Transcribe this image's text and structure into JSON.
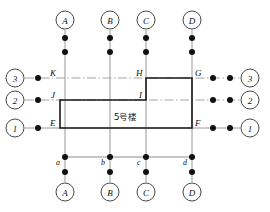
{
  "diagram": {
    "building_label": "5号楼",
    "colors": {
      "outline": "#1a1a1a",
      "gridline": "#8c8c8c",
      "centerline": "#9a9a9a",
      "node": "#111111",
      "background": "#ffffff"
    },
    "axis_top": [
      {
        "id": "A",
        "label": "A",
        "x": 65
      },
      {
        "id": "B",
        "label": "B",
        "x": 110
      },
      {
        "id": "C",
        "label": "C",
        "x": 146
      },
      {
        "id": "D",
        "label": "D",
        "x": 192
      }
    ],
    "axis_bottom": [
      {
        "id": "A",
        "label": "A",
        "x": 65
      },
      {
        "id": "B",
        "label": "B",
        "x": 110
      },
      {
        "id": "C",
        "label": "C",
        "x": 146
      },
      {
        "id": "D",
        "label": "D",
        "x": 192
      }
    ],
    "axis_left": [
      {
        "id": "3",
        "label": "3",
        "y": 78
      },
      {
        "id": "2",
        "label": "2",
        "y": 100
      },
      {
        "id": "1",
        "label": "1",
        "y": 128
      }
    ],
    "axis_right": [
      {
        "id": "3",
        "label": "3",
        "y": 78
      },
      {
        "id": "2",
        "label": "2",
        "y": 100
      },
      {
        "id": "1",
        "label": "1",
        "y": 128
      }
    ],
    "corner_points": [
      {
        "label": "K",
        "x": 60,
        "y": 78,
        "dx": -9,
        "dy": -3
      },
      {
        "label": "J",
        "x": 60,
        "y": 100,
        "dx": -9,
        "dy": -3
      },
      {
        "label": "E",
        "x": 60,
        "y": 128,
        "dx": -9,
        "dy": -3
      },
      {
        "label": "H",
        "x": 146,
        "y": 78,
        "dx": -9,
        "dy": -3
      },
      {
        "label": "I",
        "x": 146,
        "y": 100,
        "dx": -9,
        "dy": -3
      },
      {
        "label": "G",
        "x": 192,
        "y": 78,
        "dx": 3,
        "dy": -3
      },
      {
        "label": "F",
        "x": 192,
        "y": 128,
        "dx": 3,
        "dy": -3
      }
    ],
    "base_points": [
      {
        "label": "a",
        "x": 65,
        "y": 157
      },
      {
        "label": "b",
        "x": 110,
        "y": 157
      },
      {
        "label": "c",
        "x": 146,
        "y": 157
      },
      {
        "label": "d",
        "x": 192,
        "y": 157
      }
    ],
    "outline_path": "M 60 100 L 146 100 L 146 78 L 192 78 L 192 128 L 60 128 Z",
    "geometry": {
      "grid_y_3": 78,
      "grid_y_2": 100,
      "grid_y_1": 128,
      "baseline_y": 157,
      "top_circle_y": 20,
      "bottom_circle_y": 192,
      "left_circle_x": 15,
      "right_circle_x": 250,
      "circle_r": 9
    }
  }
}
